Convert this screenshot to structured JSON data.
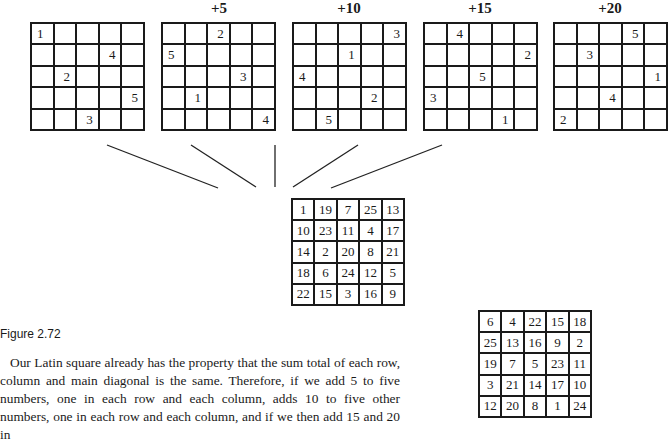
{
  "figure": {
    "latin_squares": [
      {
        "label": "",
        "cells": [
          [
            "1",
            "",
            "",
            "",
            ""
          ],
          [
            "",
            "",
            "",
            "4",
            ""
          ],
          [
            "",
            "2",
            "",
            "",
            ""
          ],
          [
            "",
            "",
            "",
            "",
            "5"
          ],
          [
            "",
            "",
            "3",
            "",
            ""
          ]
        ]
      },
      {
        "label": "+5",
        "cells": [
          [
            "",
            "",
            "2",
            "",
            ""
          ],
          [
            "5",
            "",
            "",
            "",
            ""
          ],
          [
            "",
            "",
            "",
            "3",
            ""
          ],
          [
            "",
            "1",
            "",
            "",
            ""
          ],
          [
            "",
            "",
            "",
            "",
            "4"
          ]
        ]
      },
      {
        "label": "+10",
        "cells": [
          [
            "",
            "",
            "",
            "",
            "3"
          ],
          [
            "",
            "",
            "1",
            "",
            ""
          ],
          [
            "4",
            "",
            "",
            "",
            ""
          ],
          [
            "",
            "",
            "",
            "2",
            ""
          ],
          [
            "",
            "5",
            "",
            "",
            ""
          ]
        ]
      },
      {
        "label": "+15",
        "cells": [
          [
            "",
            "4",
            "",
            "",
            ""
          ],
          [
            "",
            "",
            "",
            "",
            "2"
          ],
          [
            "",
            "",
            "5",
            "",
            ""
          ],
          [
            "3",
            "",
            "",
            "",
            ""
          ],
          [
            "",
            "",
            "",
            "1",
            ""
          ]
        ]
      },
      {
        "label": "+20",
        "cells": [
          [
            "",
            "",
            "",
            "5",
            ""
          ],
          [
            "",
            "3",
            "",
            "",
            ""
          ],
          [
            "",
            "",
            "",
            "",
            "1"
          ],
          [
            "",
            "",
            "4",
            "",
            ""
          ],
          [
            "2",
            "",
            "",
            "",
            ""
          ]
        ]
      }
    ],
    "result_square": [
      [
        "1",
        "19",
        "7",
        "25",
        "13"
      ],
      [
        "10",
        "23",
        "11",
        "4",
        "17"
      ],
      [
        "14",
        "2",
        "20",
        "8",
        "21"
      ],
      [
        "18",
        "6",
        "24",
        "12",
        "5"
      ],
      [
        "22",
        "15",
        "3",
        "16",
        "9"
      ]
    ],
    "second_square": [
      [
        "6",
        "4",
        "22",
        "15",
        "18"
      ],
      [
        "25",
        "13",
        "16",
        "9",
        "2"
      ],
      [
        "19",
        "7",
        "5",
        "23",
        "11"
      ],
      [
        "3",
        "21",
        "14",
        "17",
        "10"
      ],
      [
        "12",
        "20",
        "8",
        "1",
        "24"
      ]
    ],
    "caption": "Figure 2.72"
  },
  "text": {
    "paragraph": "Our Latin square already has the property that the sum total of each row, column and main diagonal is the same. Therefore, if we add 5 to five numbers, one in each row and each column, adds 10 to five other numbers, one in each row and each column, and if we then add 15 and 20 in"
  }
}
